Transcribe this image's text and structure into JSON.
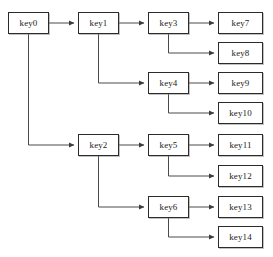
{
  "diagram": {
    "type": "tree",
    "canvas": {
      "width": 273,
      "height": 257
    },
    "style": {
      "background": "#ffffff",
      "box_border": "#2b2b2b",
      "box_fill": "#ffffff",
      "edge_color": "#4a4a4a",
      "text_color": "#1a1a1a"
    },
    "nodes": [
      {
        "id": "key0",
        "label": "key0",
        "x": 8,
        "y": 12,
        "w": 41,
        "h": 22,
        "level": 0
      },
      {
        "id": "key1",
        "label": "key1",
        "x": 78,
        "y": 12,
        "w": 41,
        "h": 22,
        "level": 1
      },
      {
        "id": "key2",
        "label": "key2",
        "x": 78,
        "y": 134,
        "w": 41,
        "h": 22,
        "level": 1
      },
      {
        "id": "key3",
        "label": "key3",
        "x": 148,
        "y": 12,
        "w": 41,
        "h": 22,
        "level": 2
      },
      {
        "id": "key4",
        "label": "key4",
        "x": 148,
        "y": 72,
        "w": 41,
        "h": 22,
        "level": 2
      },
      {
        "id": "key5",
        "label": "key5",
        "x": 148,
        "y": 134,
        "w": 41,
        "h": 22,
        "level": 2
      },
      {
        "id": "key6",
        "label": "key6",
        "x": 148,
        "y": 196,
        "w": 41,
        "h": 22,
        "level": 2
      },
      {
        "id": "key7",
        "label": "key7",
        "x": 218,
        "y": 12,
        "w": 45,
        "h": 22,
        "level": 3
      },
      {
        "id": "key8",
        "label": "key8",
        "x": 218,
        "y": 42,
        "w": 45,
        "h": 22,
        "level": 3
      },
      {
        "id": "key9",
        "label": "key9",
        "x": 218,
        "y": 72,
        "w": 45,
        "h": 22,
        "level": 3
      },
      {
        "id": "key10",
        "label": "key10",
        "x": 218,
        "y": 102,
        "w": 45,
        "h": 22,
        "level": 3
      },
      {
        "id": "key11",
        "label": "key11",
        "x": 218,
        "y": 134,
        "w": 45,
        "h": 22,
        "level": 3
      },
      {
        "id": "key12",
        "label": "key12",
        "x": 218,
        "y": 165,
        "w": 45,
        "h": 22,
        "level": 3
      },
      {
        "id": "key13",
        "label": "key13",
        "x": 218,
        "y": 196,
        "w": 45,
        "h": 22,
        "level": 3
      },
      {
        "id": "key14",
        "label": "key14",
        "x": 218,
        "y": 226,
        "w": 45,
        "h": 22,
        "level": 3
      }
    ],
    "edges": [
      {
        "from": "key0",
        "to": "key1",
        "kind": "straight"
      },
      {
        "from": "key0",
        "to": "key2",
        "kind": "elbow-down"
      },
      {
        "from": "key1",
        "to": "key3",
        "kind": "straight"
      },
      {
        "from": "key1",
        "to": "key4",
        "kind": "elbow-down"
      },
      {
        "from": "key2",
        "to": "key5",
        "kind": "straight"
      },
      {
        "from": "key2",
        "to": "key6",
        "kind": "elbow-down"
      },
      {
        "from": "key3",
        "to": "key7",
        "kind": "straight"
      },
      {
        "from": "key3",
        "to": "key8",
        "kind": "elbow-down"
      },
      {
        "from": "key4",
        "to": "key9",
        "kind": "straight"
      },
      {
        "from": "key4",
        "to": "key10",
        "kind": "elbow-down"
      },
      {
        "from": "key5",
        "to": "key11",
        "kind": "straight"
      },
      {
        "from": "key5",
        "to": "key12",
        "kind": "elbow-down"
      },
      {
        "from": "key6",
        "to": "key13",
        "kind": "straight"
      },
      {
        "from": "key6",
        "to": "key14",
        "kind": "elbow-down"
      }
    ]
  }
}
